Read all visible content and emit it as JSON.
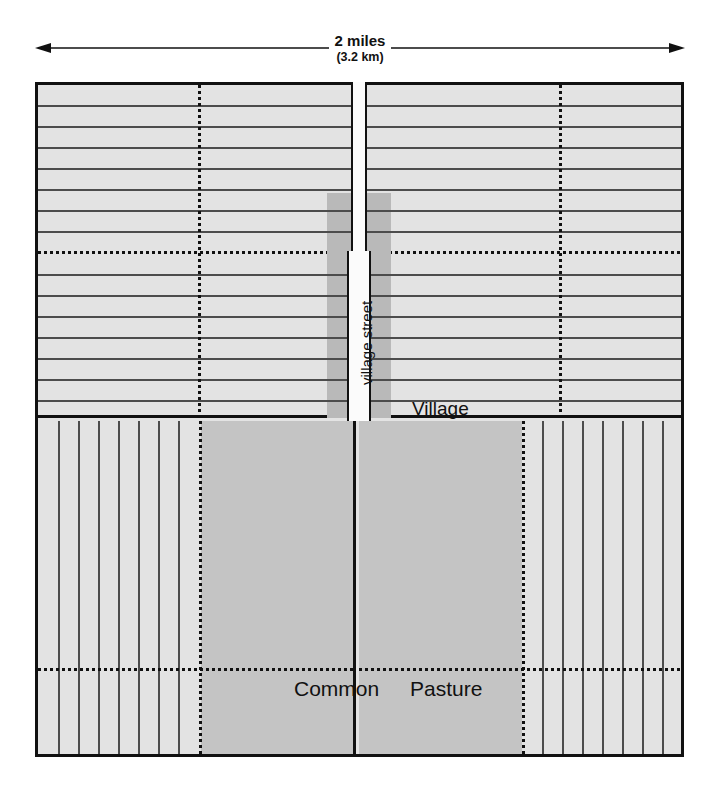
{
  "diagram": {
    "title_visible": false,
    "scale": {
      "primary_label": "2 miles",
      "secondary_label": "(3.2 km)",
      "arrow_icon": "double-headed-arrow-icon"
    },
    "labels": {
      "village": "Village",
      "village_street": "village street",
      "common": "Common",
      "pasture": "Pasture"
    },
    "colors": {
      "field_fill": "#e3e3e3",
      "pasture_fill": "#c4c4c4",
      "village_band_fill": "#b9b9b9",
      "street_fill": "#fbfbfb",
      "stroke": "#111111",
      "strip_line": "#4c4c4c",
      "background": "#ffffff"
    },
    "structure": {
      "quadrants": [
        {
          "name": "top-left",
          "field_type": "horizontal-strips",
          "strip_count": 16
        },
        {
          "name": "top-right",
          "field_type": "horizontal-strips",
          "strip_count": 16
        },
        {
          "name": "bottom-left",
          "field_type": "vertical-strips",
          "strip_count": 8
        },
        {
          "name": "bottom-right",
          "field_type": "vertical-strips",
          "strip_count": 8
        }
      ],
      "dotted_subdivision": true,
      "village_street_orientation": "vertical-center"
    }
  }
}
